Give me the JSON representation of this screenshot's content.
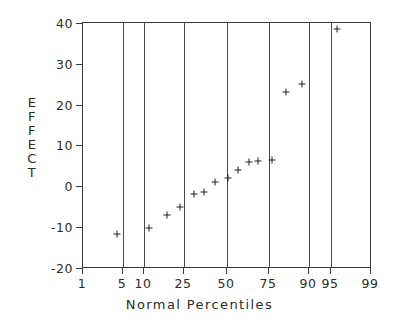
{
  "chart_data": {
    "type": "scatter",
    "title": "",
    "xlabel": "Normal Percentiles",
    "ylabel": "EFFECT",
    "ylabel_chars": [
      "E",
      "F",
      "F",
      "E",
      "C",
      "T"
    ],
    "x_scale": "normal-probability",
    "xlim": [
      1,
      99
    ],
    "ylim": [
      -20,
      40
    ],
    "xticks": [
      1,
      5,
      10,
      25,
      50,
      75,
      90,
      95,
      99
    ],
    "xtick_labels": [
      "1",
      "5",
      "10",
      "25",
      "50",
      "75",
      "90",
      "95",
      "99"
    ],
    "yticks": [
      -20,
      -10,
      0,
      10,
      20,
      30,
      40
    ],
    "ytick_labels": [
      "-20",
      "-10",
      "0",
      "10",
      "20",
      "30",
      "40"
    ],
    "grid": "vertical-only",
    "gridlines_x": [
      5,
      10,
      25,
      50,
      75,
      90,
      95
    ],
    "legend": null,
    "marker": "plus",
    "marker_color": "#1f1f1f",
    "frame_color": "#3a3a3a",
    "background": "#ffffff",
    "points": [
      {
        "x": 4.0,
        "y": -11.7
      },
      {
        "x": 11.0,
        "y": -10.2
      },
      {
        "x": 17.5,
        "y": -7.1
      },
      {
        "x": 23.0,
        "y": -5.1
      },
      {
        "x": 31.0,
        "y": -2.0
      },
      {
        "x": 36.5,
        "y": -1.5
      },
      {
        "x": 44.5,
        "y": 1.0
      },
      {
        "x": 51.0,
        "y": 2.0
      },
      {
        "x": 56.5,
        "y": 3.9
      },
      {
        "x": 63.0,
        "y": 5.9
      },
      {
        "x": 68.0,
        "y": 6.1
      },
      {
        "x": 76.0,
        "y": 6.3
      },
      {
        "x": 84.0,
        "y": 22.9
      },
      {
        "x": 90.0,
        "y": 24.9
      },
      {
        "x": 96.0,
        "y": 38.3
      }
    ],
    "point_pixels": [
      [
        117,
        234
      ],
      [
        149,
        228
      ],
      [
        167,
        215
      ],
      [
        180,
        207
      ],
      [
        194,
        194
      ],
      [
        204,
        192
      ],
      [
        215,
        182
      ],
      [
        228,
        178
      ],
      [
        238,
        170
      ],
      [
        249,
        162
      ],
      [
        258,
        161
      ],
      [
        272,
        160
      ],
      [
        286,
        92
      ],
      [
        302,
        84
      ],
      [
        337,
        29
      ]
    ],
    "xtick_pixels": [
      82,
      122,
      143,
      183,
      226,
      268,
      308,
      330,
      370
    ],
    "ytick_pixels": [
      268,
      227,
      186,
      145,
      105,
      64,
      23
    ]
  }
}
